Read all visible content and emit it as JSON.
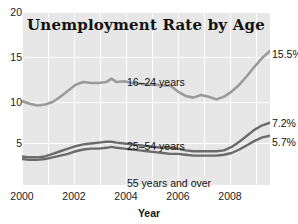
{
  "chart_data": {
    "type": "line",
    "title": "Unemployment Rate by Age",
    "xlabel": "Year",
    "ylabel": "",
    "xlim": [
      2000,
      2009.7
    ],
    "ylim": [
      0,
      20
    ],
    "yticks": [
      5,
      10,
      15,
      20
    ],
    "xticks": [
      2000,
      2002,
      2004,
      2006,
      2008
    ],
    "grid": true,
    "legend_position": "inline-annotations",
    "series": [
      {
        "name": "16-24 years",
        "label": "16–24 years",
        "end_value_label": "15.5%",
        "end_value": 15.5,
        "color": "#9a9a9a",
        "x": [
          2000.0,
          2000.3,
          2000.6,
          2000.9,
          2001.2,
          2001.5,
          2001.8,
          2002.1,
          2002.4,
          2002.7,
          2003.0,
          2003.3,
          2003.5,
          2003.7,
          2004.0,
          2004.3,
          2004.6,
          2004.9,
          2005.2,
          2005.5,
          2005.8,
          2006.1,
          2006.4,
          2006.7,
          2007.0,
          2007.3,
          2007.6,
          2007.9,
          2008.2,
          2008.5,
          2008.8,
          2009.1,
          2009.4,
          2009.7
        ],
        "values": [
          9.7,
          9.4,
          9.2,
          9.3,
          9.6,
          10.2,
          10.9,
          11.6,
          11.9,
          11.8,
          11.8,
          11.9,
          12.3,
          11.9,
          12.0,
          11.8,
          11.7,
          11.6,
          11.6,
          11.5,
          11.5,
          10.8,
          10.3,
          10.1,
          10.4,
          10.2,
          9.9,
          10.2,
          10.8,
          11.6,
          12.6,
          13.7,
          14.7,
          15.5
        ]
      },
      {
        "name": "25-54 years",
        "label": "25–54 years",
        "end_value_label": "7.2%",
        "end_value": 7.2,
        "color": "#6b6b6b",
        "x": [
          2000.0,
          2000.3,
          2000.6,
          2000.9,
          2001.2,
          2001.5,
          2001.8,
          2002.1,
          2002.4,
          2002.7,
          2003.0,
          2003.3,
          2003.5,
          2003.7,
          2004.0,
          2004.3,
          2004.6,
          2004.9,
          2005.2,
          2005.5,
          2005.8,
          2006.1,
          2006.4,
          2006.7,
          2007.0,
          2007.3,
          2007.6,
          2007.9,
          2008.2,
          2008.5,
          2008.8,
          2009.1,
          2009.4,
          2009.7
        ],
        "values": [
          3.3,
          3.2,
          3.2,
          3.3,
          3.6,
          3.9,
          4.2,
          4.5,
          4.7,
          4.8,
          4.9,
          5.0,
          5.0,
          4.9,
          4.8,
          4.7,
          4.6,
          4.5,
          4.4,
          4.3,
          4.3,
          4.2,
          4.0,
          3.9,
          3.9,
          3.9,
          3.9,
          4.0,
          4.4,
          5.0,
          5.7,
          6.4,
          6.9,
          7.2
        ]
      },
      {
        "name": "55 years and over",
        "label": "55 years and over",
        "end_value_label": "5.7%",
        "end_value": 5.7,
        "color": "#6b6b6b",
        "x": [
          2000.0,
          2000.3,
          2000.6,
          2000.9,
          2001.2,
          2001.5,
          2001.8,
          2002.1,
          2002.4,
          2002.7,
          2003.0,
          2003.3,
          2003.5,
          2003.7,
          2004.0,
          2004.3,
          2004.6,
          2004.9,
          2005.2,
          2005.5,
          2005.8,
          2006.1,
          2006.4,
          2006.7,
          2007.0,
          2007.3,
          2007.6,
          2007.9,
          2008.2,
          2008.5,
          2008.8,
          2009.1,
          2009.4,
          2009.7
        ],
        "values": [
          3.0,
          2.9,
          2.9,
          3.0,
          3.2,
          3.4,
          3.6,
          3.9,
          4.1,
          4.2,
          4.2,
          4.3,
          4.4,
          4.3,
          4.2,
          4.1,
          4.0,
          3.9,
          3.8,
          3.7,
          3.6,
          3.6,
          3.5,
          3.4,
          3.4,
          3.4,
          3.4,
          3.5,
          3.7,
          4.1,
          4.6,
          5.1,
          5.5,
          5.7
        ]
      }
    ]
  },
  "title": "Unemployment Rate by Age",
  "axis": {
    "x_title": "Year",
    "yticks": [
      "20",
      "15",
      "10",
      "5"
    ],
    "xticks": [
      "2000",
      "2002",
      "2004",
      "2006",
      "2008"
    ]
  },
  "annotations": {
    "youth_label": "16–24 years",
    "prime_label": "25–54 years",
    "senior_label": "55 years and over",
    "youth_end": "15.5%",
    "prime_end": "7.2%",
    "senior_end": "5.7%"
  },
  "colors": {
    "plot_background": "#e7e7e7",
    "gridline": "#ffffff",
    "youth_line": "#9a9a9a",
    "adult_line": "#6b6b6b",
    "text": "#111111"
  }
}
